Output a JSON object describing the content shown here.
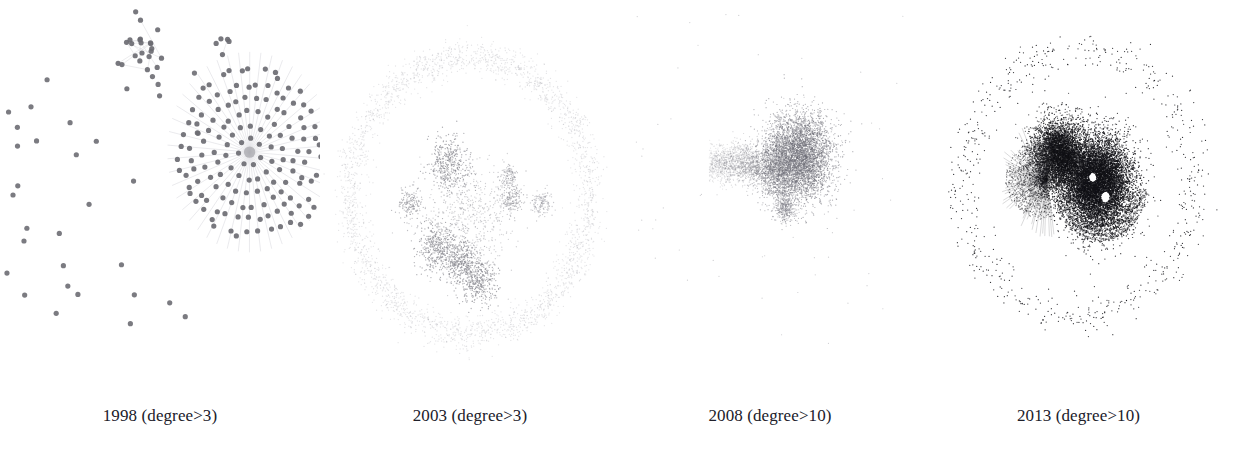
{
  "figure": {
    "background_color": "#ffffff",
    "caption_color": "#20202a",
    "width": 1237,
    "height": 465
  },
  "chart_data": {
    "type": "scatter",
    "xlabel": "",
    "ylabel": "",
    "grid": false,
    "legend_position": "none",
    "panels": [
      {
        "id": "panel-1998",
        "year": 1998,
        "degree_filter": "degree>3",
        "caption": "1998 (degree>3)",
        "node_count": 215,
        "node_color": "#6d6d73",
        "node_radius": 2.6,
        "edge_color": "#c9c9cf",
        "density": "sparse",
        "structure": "one dense radial hub with concentric rings, one small satellite cluster, many isolated nodes",
        "components": [
          {
            "kind": "radial-hub",
            "cx": 0.78,
            "cy": 0.39,
            "rings": 7,
            "ring_spacing": 0.036,
            "nodes": 150
          },
          {
            "kind": "small-cluster",
            "cx": 0.44,
            "cy": 0.12,
            "spread": 0.07,
            "nodes": 24
          },
          {
            "kind": "small-cluster",
            "cx": 0.7,
            "cy": 0.1,
            "spread": 0.04,
            "nodes": 5
          },
          {
            "kind": "scatter",
            "cx": 0.3,
            "cy": 0.5,
            "spread": 0.33,
            "nodes": 36
          }
        ]
      },
      {
        "id": "panel-2003",
        "year": 2003,
        "degree_filter": "degree>3",
        "caption": "2003 (degree>3)",
        "node_count": 5200,
        "node_color": "#8a8a92",
        "node_radius": 0.65,
        "edge_color": "#e2e2e8",
        "density": "medium",
        "structure": "faint peripheral ring of low-degree nodes surrounding a center of several medium-dark blobs joined by filaments",
        "components": [
          {
            "kind": "ring",
            "cx": 0.5,
            "cy": 0.5,
            "radius": 0.4,
            "band": 0.05,
            "nodes": 2600,
            "opacity": 0.22
          },
          {
            "kind": "blob",
            "cx": 0.43,
            "cy": 0.42,
            "spread": 0.055,
            "nodes": 420,
            "opacity": 0.7
          },
          {
            "kind": "blob",
            "cx": 0.39,
            "cy": 0.63,
            "spread": 0.05,
            "nodes": 400,
            "opacity": 0.7
          },
          {
            "kind": "blob",
            "cx": 0.47,
            "cy": 0.67,
            "spread": 0.042,
            "nodes": 330,
            "opacity": 0.7
          },
          {
            "kind": "blob",
            "cx": 0.53,
            "cy": 0.72,
            "spread": 0.05,
            "nodes": 400,
            "opacity": 0.7
          },
          {
            "kind": "blob",
            "cx": 0.3,
            "cy": 0.52,
            "spread": 0.032,
            "nodes": 180,
            "opacity": 0.55
          },
          {
            "kind": "blob",
            "cx": 0.64,
            "cy": 0.51,
            "spread": 0.03,
            "nodes": 170,
            "opacity": 0.55
          },
          {
            "kind": "blob",
            "cx": 0.63,
            "cy": 0.45,
            "spread": 0.022,
            "nodes": 110,
            "opacity": 0.5
          },
          {
            "kind": "blob",
            "cx": 0.74,
            "cy": 0.52,
            "spread": 0.026,
            "nodes": 130,
            "opacity": 0.45
          },
          {
            "kind": "mesh",
            "cx": 0.5,
            "cy": 0.56,
            "spread": 0.11,
            "nodes": 560,
            "opacity": 0.4
          }
        ]
      },
      {
        "id": "panel-2008",
        "year": 2008,
        "degree_filter": "degree>10",
        "caption": "2008 (degree>10)",
        "node_count": 9000,
        "node_color": "#6f6f78",
        "node_radius": 0.6,
        "edge_color": "#d5d5db",
        "density": "high",
        "structure": "single large dense gray blob with a tapering tail to the left and a small spur below; a few isolated outliers scattered widely",
        "components": [
          {
            "kind": "blob",
            "cx": 0.6,
            "cy": 0.4,
            "spread": 0.085,
            "nodes": 4200,
            "opacity": 0.55
          },
          {
            "kind": "blob",
            "cx": 0.52,
            "cy": 0.43,
            "spread": 0.06,
            "nodes": 1500,
            "opacity": 0.45
          },
          {
            "kind": "tail",
            "cx": 0.38,
            "cy": 0.42,
            "spread": 0.075,
            "nodes": 1300,
            "opacity": 0.35
          },
          {
            "kind": "blob",
            "cx": 0.55,
            "cy": 0.53,
            "spread": 0.03,
            "nodes": 400,
            "opacity": 0.4
          },
          {
            "kind": "scatter",
            "cx": 0.5,
            "cy": 0.45,
            "spread": 0.45,
            "nodes": 60,
            "opacity": 0.35
          }
        ]
      },
      {
        "id": "panel-2013",
        "year": 2013,
        "degree_filter": "degree>10",
        "caption": "2013 (degree>10)",
        "node_count": 24000,
        "node_color": "#121216",
        "node_radius": 0.62,
        "edge_color": "#3a3a42",
        "density": "very high",
        "structure": "near-black two-lobed dense core with hairline spokes fanning left, concentric arcs at lower right, and a wide ring band of small isolated dark nodes",
        "components": [
          {
            "kind": "core",
            "cx": 0.56,
            "cy": 0.47,
            "spread": 0.085,
            "nodes": 9000,
            "opacity": 0.85
          },
          {
            "kind": "core",
            "cx": 0.44,
            "cy": 0.4,
            "spread": 0.065,
            "nodes": 5200,
            "opacity": 0.75
          },
          {
            "kind": "spokes",
            "cx": 0.4,
            "cy": 0.46,
            "radius": 0.13,
            "nodes": 1400,
            "opacity": 0.45
          },
          {
            "kind": "arc",
            "cx": 0.57,
            "cy": 0.48,
            "radius": 0.105,
            "band": 0.022,
            "nodes": 900,
            "opacity": 0.55
          },
          {
            "kind": "ring",
            "cx": 0.5,
            "cy": 0.47,
            "radius": 0.365,
            "band": 0.055,
            "nodes": 620,
            "opacity": 0.85
          },
          {
            "kind": "void",
            "cx": 0.545,
            "cy": 0.455,
            "spread": 0.012
          },
          {
            "kind": "void",
            "cx": 0.585,
            "cy": 0.505,
            "spread": 0.014
          }
        ]
      }
    ]
  }
}
